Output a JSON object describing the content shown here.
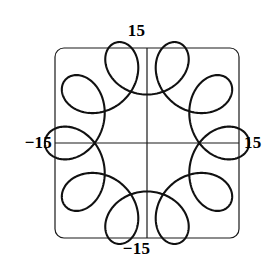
{
  "figure": {
    "title": "",
    "background_color": "#ffffff",
    "frame": {
      "stroke_color": "#1a1a1a",
      "stroke_width": 1.2,
      "corner_radius": 9,
      "x_min_px": 55,
      "y_min_px": 48,
      "x_max_px": 239,
      "y_max_px": 238
    },
    "axes": {
      "stroke_color": "#1a1a1a",
      "stroke_width": 1.2,
      "origin_x_px": 147,
      "origin_y_px": 143,
      "show_x_axis": true,
      "show_y_axis": true,
      "show_grid": false
    },
    "labels": {
      "top": "15",
      "bottom": "−15",
      "left": "−15",
      "right": "15"
    }
  },
  "chart_data": {
    "type": "line",
    "title": "",
    "xlabel": "",
    "ylabel": "",
    "xlim": [
      -15,
      15
    ],
    "ylim": [
      -15,
      15
    ],
    "xticks": [
      -15,
      15
    ],
    "yticks": [
      -15,
      15
    ],
    "xticklabels": [
      "−15",
      "15"
    ],
    "yticklabels": [
      "−15",
      "15"
    ],
    "grid": false,
    "legend": false,
    "legend_position": "none",
    "series": [
      {
        "name": "hypotrochoid",
        "curve_family": "hypotrochoid",
        "description": "Closed radial curve with 9 inward teardrop loops inscribed in a circle of radius about 13.5 units",
        "color": "#111111",
        "line_width": 2.1,
        "closed": true,
        "loop_count": 9,
        "parametric": {
          "x": "(R - r) * cos(t) + d * cos(((R - r) / r) * t)",
          "y": "(R - r) * sin(t) - d * sin(((R - r) / r) * t)",
          "R": 13.5,
          "r": 1.35,
          "d": 4.5,
          "t_start": 0,
          "t_end": 6.283185307179586,
          "t_samples": 1200,
          "phase_offset_deg": 90
        },
        "extent": {
          "x_min": -13.5,
          "x_max": 13.5,
          "y_min": -13.5,
          "y_max": 13.5
        }
      }
    ]
  }
}
